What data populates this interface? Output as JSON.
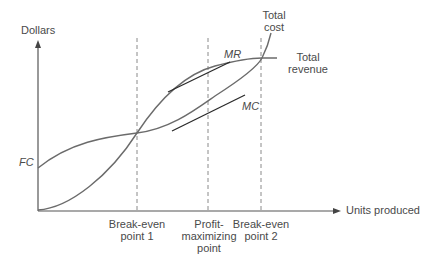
{
  "diagram": {
    "title": "",
    "type": "break-even / profit-maximization diagram",
    "y_axis": {
      "label": "Dollars"
    },
    "x_axis": {
      "label": "Units produced"
    },
    "curves": [
      {
        "name": "Total cost",
        "label_line1": "Total",
        "label_line2": "cost",
        "starts_at": "FC"
      },
      {
        "name": "Total revenue",
        "label_line1": "Total",
        "label_line2": "revenue",
        "starts_at": "origin"
      }
    ],
    "tangents": [
      {
        "name": "MR",
        "label": "MR",
        "on_curve": "Total revenue"
      },
      {
        "name": "MC",
        "label": "MC",
        "on_curve": "Total cost"
      }
    ],
    "fixed_cost_label": "FC",
    "markers": [
      {
        "name": "break-even-1",
        "line1": "Break-even",
        "line2": "point 1",
        "line3": ""
      },
      {
        "name": "profit-max",
        "line1": "Profit-",
        "line2": "maximizing",
        "line3": "point"
      },
      {
        "name": "break-even-2",
        "line1": "Break-even",
        "line2": "point 2",
        "line3": ""
      }
    ],
    "colors": {
      "axis": "#555555",
      "curve": "#6b6b6b",
      "tangent": "#2a2a2a",
      "dashed": "#8a8a8a",
      "text": "#4a4a4a"
    }
  }
}
